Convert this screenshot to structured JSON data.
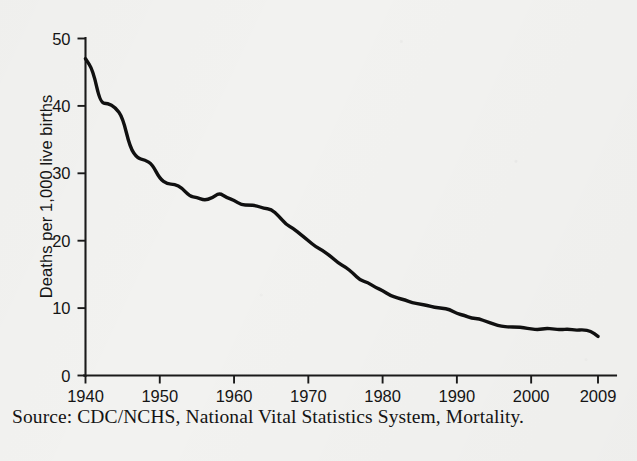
{
  "figure": {
    "source_note": "Source: CDC/NCHS, National Vital Statistics System, Mortality.",
    "y_axis_title": "Deaths per 1,000 live births",
    "line_color": "#101010",
    "axis_color": "#1a1a1a",
    "background_color": "#f2f2f0"
  },
  "chart_data": {
    "type": "line",
    "title": "",
    "subtitle": "",
    "xlabel": "",
    "ylabel": "Deaths per 1,000 live births",
    "xlim": [
      1940,
      2009
    ],
    "ylim": [
      0,
      50
    ],
    "grid": false,
    "legend": false,
    "legend_position": "none",
    "x_tick_labels": [
      "1940",
      "1950",
      "1960",
      "1970",
      "1980",
      "1990",
      "2000",
      "2009"
    ],
    "x_ticks": [
      1940,
      1950,
      1960,
      1970,
      1980,
      1990,
      2000,
      2009
    ],
    "y_tick_labels": [
      "0",
      "10",
      "20",
      "30",
      "40",
      "50"
    ],
    "y_ticks": [
      0,
      10,
      20,
      30,
      40,
      50
    ],
    "annotations": [],
    "series": [
      {
        "name": "Infant mortality rate",
        "x": [
          1940,
          1941,
          1942,
          1943,
          1944,
          1945,
          1946,
          1947,
          1948,
          1949,
          1950,
          1951,
          1952,
          1953,
          1954,
          1955,
          1956,
          1957,
          1958,
          1959,
          1960,
          1961,
          1962,
          1963,
          1964,
          1965,
          1966,
          1967,
          1968,
          1969,
          1970,
          1971,
          1972,
          1973,
          1974,
          1975,
          1976,
          1977,
          1978,
          1979,
          1980,
          1981,
          1982,
          1983,
          1984,
          1985,
          1986,
          1987,
          1988,
          1989,
          1990,
          1991,
          1992,
          1993,
          1994,
          1995,
          1996,
          1997,
          1998,
          1999,
          2000,
          2001,
          2002,
          2003,
          2004,
          2005,
          2006,
          2007,
          2008,
          2009
        ],
        "values": [
          47.0,
          45.3,
          40.4,
          40.4,
          39.8,
          38.3,
          33.8,
          32.2,
          32.0,
          31.3,
          29.2,
          28.4,
          28.4,
          27.8,
          26.6,
          26.4,
          26.0,
          26.3,
          27.1,
          26.4,
          26.0,
          25.3,
          25.3,
          25.2,
          24.8,
          24.7,
          23.7,
          22.4,
          21.8,
          20.9,
          20.0,
          19.1,
          18.5,
          17.7,
          16.7,
          16.1,
          15.2,
          14.1,
          13.8,
          13.1,
          12.6,
          11.9,
          11.5,
          11.2,
          10.8,
          10.6,
          10.4,
          10.1,
          10.0,
          9.8,
          9.2,
          8.9,
          8.5,
          8.4,
          8.0,
          7.6,
          7.3,
          7.2,
          7.2,
          7.1,
          6.9,
          6.8,
          7.0,
          6.9,
          6.8,
          6.9,
          6.7,
          6.8,
          6.6,
          5.8
        ]
      }
    ]
  }
}
